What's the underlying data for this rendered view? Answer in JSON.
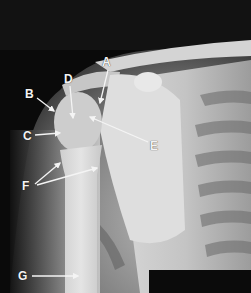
{
  "figure": {
    "labels": [
      {
        "id": "A",
        "text": "A",
        "x": 102,
        "y": 56,
        "arrow": {
          "x1": 108,
          "y1": 70,
          "x2": 100,
          "y2": 103
        }
      },
      {
        "id": "B",
        "text": "B",
        "x": 25,
        "y": 88,
        "arrow": {
          "x1": 37,
          "y1": 98,
          "x2": 54,
          "y2": 111
        }
      },
      {
        "id": "C",
        "text": "C",
        "x": 23,
        "y": 130,
        "arrow": {
          "x1": 35,
          "y1": 135,
          "x2": 60,
          "y2": 133
        }
      },
      {
        "id": "D",
        "text": "D",
        "x": 64,
        "y": 73,
        "arrow": {
          "x1": 70,
          "y1": 86,
          "x2": 73,
          "y2": 118
        }
      },
      {
        "id": "E",
        "text": "E",
        "x": 150,
        "y": 140,
        "arrow": {
          "x1": 148,
          "y1": 142,
          "x2": 90,
          "y2": 117
        }
      },
      {
        "id": "F",
        "text": "F",
        "x": 22,
        "y": 180,
        "arrows": [
          {
            "x1": 35,
            "y1": 184,
            "x2": 60,
            "y2": 163
          },
          {
            "x1": 37,
            "y1": 185,
            "x2": 97,
            "y2": 168
          }
        ]
      },
      {
        "id": "G",
        "text": "G",
        "x": 18,
        "y": 270,
        "arrow": {
          "x1": 32,
          "y1": 276,
          "x2": 78,
          "y2": 276
        }
      }
    ],
    "colors": {
      "background": "#0a0a0a",
      "bone": "#d8d8d8",
      "label": "#f4f4f4",
      "redaction_box": "#0b0b0b"
    }
  }
}
